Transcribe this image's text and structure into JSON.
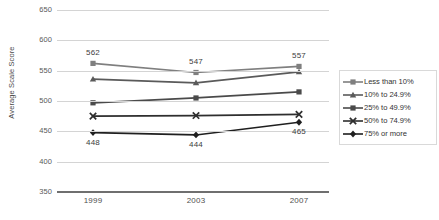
{
  "chart_data": {
    "type": "line",
    "title": "",
    "xlabel": "",
    "ylabel": "Average Scale Score",
    "categories": [
      "1999",
      "2003",
      "2007"
    ],
    "ylim": [
      350,
      650
    ],
    "yticks": [
      650,
      600,
      550,
      500,
      450,
      400,
      350
    ],
    "grid": true,
    "legend_position": "right",
    "series": [
      {
        "name": "Less than 10%",
        "marker": "square",
        "color": "#7f7f7f",
        "values": [
          562,
          547,
          557
        ],
        "labels": [
          "562",
          "547",
          "557"
        ],
        "label_position": "above"
      },
      {
        "name": "10% to 24.9%",
        "marker": "triangle",
        "color": "#5a5a5a",
        "values": [
          536,
          530,
          548
        ],
        "labels": [
          "",
          "",
          ""
        ],
        "label_position": "none"
      },
      {
        "name": "25% to 49.9%",
        "marker": "square",
        "color": "#4a4a4a",
        "values": [
          497,
          505,
          515
        ],
        "labels": [
          "",
          "",
          ""
        ],
        "label_position": "none"
      },
      {
        "name": "50% to 74.9%",
        "marker": "x",
        "color": "#2e2e2e",
        "values": [
          475,
          476,
          478
        ],
        "labels": [
          "",
          "",
          ""
        ],
        "label_position": "none"
      },
      {
        "name": "75% or more",
        "marker": "diamond",
        "color": "#1f1f1f",
        "values": [
          448,
          444,
          465
        ],
        "labels": [
          "448",
          "444",
          "465"
        ],
        "label_position": "below"
      }
    ]
  },
  "legend": {
    "items": [
      {
        "label": "Less than 10%"
      },
      {
        "label": "10% to 24.9%"
      },
      {
        "label": "25% to 49.9%"
      },
      {
        "label": "50% to 74.9%"
      },
      {
        "label": "75% or more"
      }
    ]
  },
  "caption": {
    "text": ""
  }
}
